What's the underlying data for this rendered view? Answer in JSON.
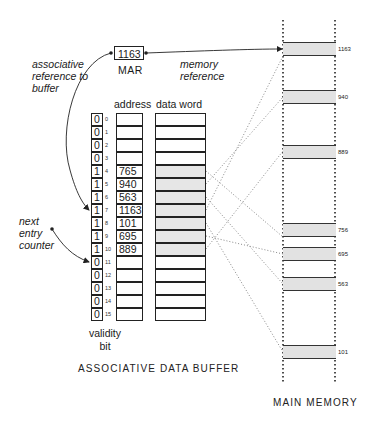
{
  "figure": {
    "mar": {
      "value": "1163",
      "label": "MAR"
    },
    "annotations": {
      "associative_reference": [
        "associative",
        "reference to",
        "buffer"
      ],
      "memory_reference": [
        "memory",
        "reference"
      ],
      "next_entry_counter": [
        "next",
        "entry",
        "counter"
      ]
    },
    "buffer": {
      "column_headers": {
        "address": "address",
        "data_word": "data word"
      },
      "validity_label": [
        "validity",
        "bit"
      ],
      "caption": "ASSOCIATIVE DATA BUFFER",
      "rows": [
        {
          "index": "0",
          "valid": "0",
          "address": ""
        },
        {
          "index": "1",
          "valid": "0",
          "address": ""
        },
        {
          "index": "2",
          "valid": "0",
          "address": ""
        },
        {
          "index": "3",
          "valid": "0",
          "address": ""
        },
        {
          "index": "4",
          "valid": "1",
          "address": "765"
        },
        {
          "index": "5",
          "valid": "1",
          "address": "940"
        },
        {
          "index": "6",
          "valid": "1",
          "address": "563"
        },
        {
          "index": "7",
          "valid": "1",
          "address": "1163"
        },
        {
          "index": "8",
          "valid": "1",
          "address": "101"
        },
        {
          "index": "9",
          "valid": "1",
          "address": "695"
        },
        {
          "index": "10",
          "valid": "1",
          "address": "889"
        },
        {
          "index": "11",
          "valid": "0",
          "address": ""
        },
        {
          "index": "12",
          "valid": "0",
          "address": ""
        },
        {
          "index": "13",
          "valid": "0",
          "address": ""
        },
        {
          "index": "14",
          "valid": "0",
          "address": ""
        },
        {
          "index": "15",
          "valid": "0",
          "address": ""
        }
      ]
    },
    "main_memory": {
      "caption": "MAIN MEMORY",
      "blocks": [
        {
          "label": "1163",
          "top": 42
        },
        {
          "label": "940",
          "top": 90
        },
        {
          "label": "889",
          "top": 145
        },
        {
          "label": "756",
          "top": 223
        },
        {
          "label": "695",
          "top": 247
        },
        {
          "label": "563",
          "top": 277
        },
        {
          "label": "101",
          "top": 345
        }
      ]
    }
  }
}
